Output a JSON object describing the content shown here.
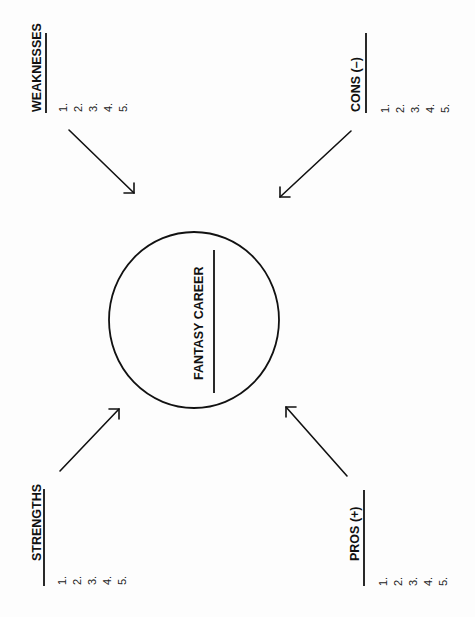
{
  "worksheet": {
    "orientation": "rotated-90-ccw",
    "center": {
      "title": "FANTASY CAREER"
    },
    "sections": {
      "weaknesses": {
        "title": "WEAKNESSES",
        "items": [
          "1.",
          "2.",
          "3.",
          "4.",
          "5."
        ]
      },
      "cons": {
        "title": "CONS (–)",
        "items": [
          "1.",
          "2.",
          "3.",
          "4.",
          "5."
        ]
      },
      "strengths": {
        "title": "STRENGTHS",
        "items": [
          "1.",
          "2.",
          "3.",
          "4.",
          "5."
        ]
      },
      "pros": {
        "title": "PROS (+)",
        "items": [
          "1.",
          "2.",
          "3.",
          "4.",
          "5."
        ]
      }
    },
    "colors": {
      "ink": "#111111",
      "paper": "#fdfdfd"
    }
  }
}
